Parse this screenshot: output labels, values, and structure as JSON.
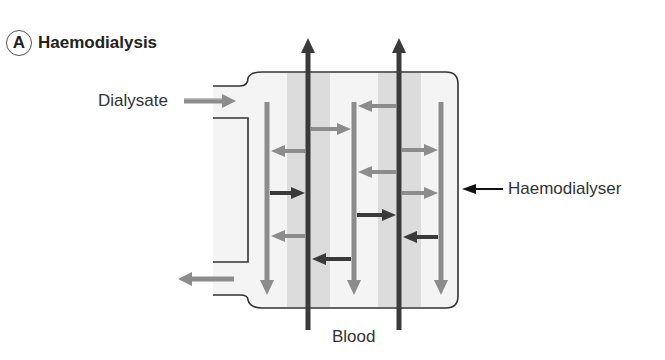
{
  "figure": {
    "panel_letter": "A",
    "title": "Haemodialysis"
  },
  "labels": {
    "dialysate": "Dialysate",
    "haemodialyser": "Haemodialyser",
    "blood": "Blood"
  },
  "colors": {
    "blood_tube": "#3a3a3a",
    "dialysate_arrow": "#8c8c8c",
    "band": "#dcdcdc",
    "box_fill": "#f4f4f4",
    "outline": "#333333"
  },
  "flows": {
    "blood_direction": "up",
    "dialysate_direction": "down",
    "dialysate_inlet": "left-top",
    "dialysate_outlet": "left-bottom"
  }
}
